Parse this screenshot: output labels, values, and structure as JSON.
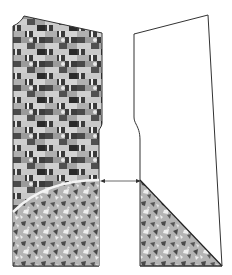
{
  "diagram": {
    "colors": {
      "background": "#ffffff",
      "outline": "#333333",
      "check_dark": "#3c3c3c",
      "check_mid": "#8a8a8a",
      "check_light": "#c8c8c8",
      "camo_base": "#b4b4b4",
      "camo_dark": "#4a4a4a",
      "camo_light": "#eeeeee",
      "arrow": "#444444"
    },
    "pieces": [
      {
        "name": "left-piece",
        "fill": "patchwork-check",
        "bottom_fill": "camo-curve"
      },
      {
        "name": "right-piece",
        "fill": "none",
        "bottom_fill": "camo-triangle"
      }
    ],
    "connector": {
      "type": "double-arrow",
      "y": 181
    }
  }
}
